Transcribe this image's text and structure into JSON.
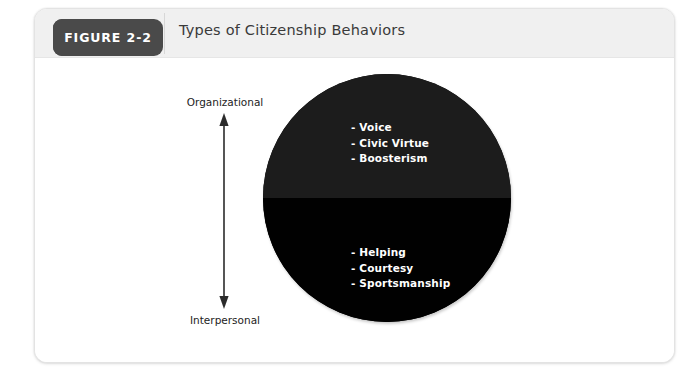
{
  "figure": {
    "tab_label": "FIGURE 2-2",
    "title": "Types of Citizenship Behaviors"
  },
  "axis": {
    "top_label": "Organizational",
    "bottom_label": "Interpersonal",
    "arrow_icon": "double-headed-vertical-arrow-icon",
    "arrow_color": "#2b2b2b"
  },
  "diagram": {
    "type": "split-circle",
    "circle_color_top": "#1c1c1c",
    "circle_color_bottom": "#010101",
    "text_color": "#ffffff",
    "organizational": {
      "group": "Organizational Citizenship Behaviors",
      "items": [
        "- Voice",
        "- Civic Virtue",
        "- Boosterism"
      ]
    },
    "interpersonal": {
      "group": "Interpersonal Citizenship Behaviors",
      "items": [
        "- Helping",
        "- Courtesy",
        "- Sportsmanship"
      ]
    }
  }
}
